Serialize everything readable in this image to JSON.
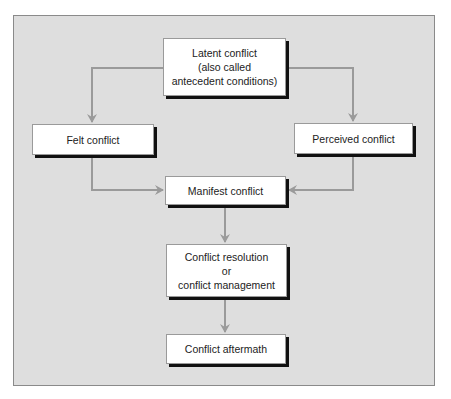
{
  "diagram": {
    "colors": {
      "panel_background": "#dedede",
      "panel_border": "#8a8a8a",
      "box_background": "#ffffff",
      "box_shadow": "#111111",
      "connector": "#9a9a9a",
      "text": "#222222"
    },
    "nodes": {
      "latent": {
        "lines": [
          "Latent conflict",
          "(also called",
          "antecedent conditions)"
        ]
      },
      "felt": {
        "lines": [
          "Felt conflict"
        ]
      },
      "perceived": {
        "lines": [
          "Perceived conflict"
        ]
      },
      "manifest": {
        "lines": [
          "Manifest conflict"
        ]
      },
      "resolution": {
        "lines": [
          "Conflict resolution",
          "or",
          "conflict management"
        ]
      },
      "aftermath": {
        "lines": [
          "Conflict aftermath"
        ]
      }
    },
    "edges": [
      {
        "from": "latent",
        "to": "felt"
      },
      {
        "from": "latent",
        "to": "perceived"
      },
      {
        "from": "felt",
        "to": "manifest"
      },
      {
        "from": "perceived",
        "to": "manifest"
      },
      {
        "from": "manifest",
        "to": "resolution"
      },
      {
        "from": "resolution",
        "to": "aftermath"
      }
    ]
  }
}
